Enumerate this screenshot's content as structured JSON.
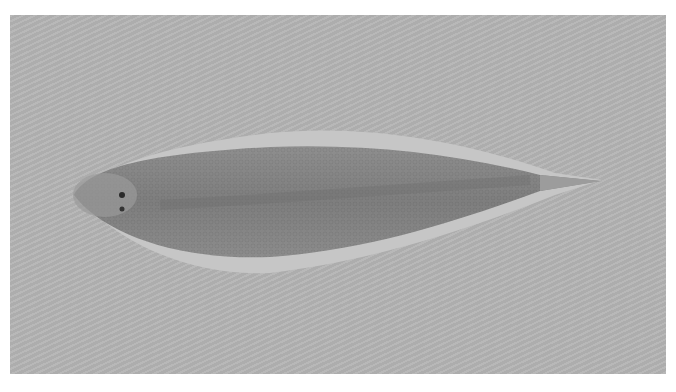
{
  "image": {
    "subject": "sole fish specimen (dorsal view) on gray background",
    "colors": {
      "page_background": "#ffffff",
      "photo_background": "#b4b4b4",
      "fish_body": "#8a8a8a",
      "fish_fin": "#c4c4c4",
      "fish_dark": "#6e6e6e"
    }
  }
}
